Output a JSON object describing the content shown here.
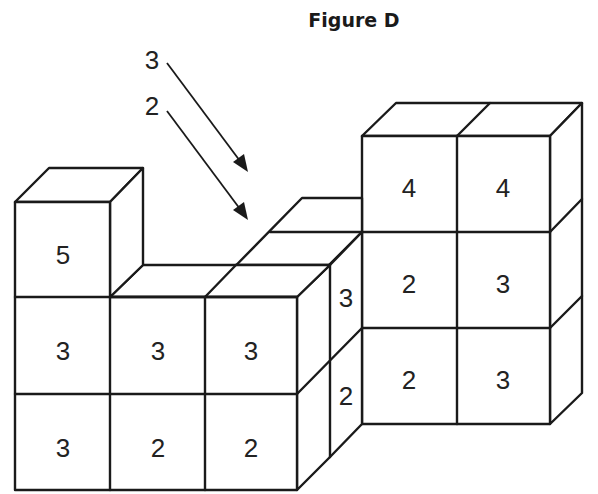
{
  "figure": {
    "title": "Figure D",
    "colors": {
      "line": "#1a1a1a",
      "background": "#ffffff"
    }
  },
  "arrows": [
    {
      "label": "3",
      "points_to": "top of back middle column"
    },
    {
      "label": "2",
      "points_to": "top of middle middle column"
    }
  ],
  "left_block": {
    "front_faces": {
      "row_top": [
        "5"
      ],
      "row_middle": [
        "3",
        "3",
        "3"
      ],
      "row_bottom": [
        "3",
        "2",
        "2"
      ]
    },
    "side_faces": {
      "upper": "3",
      "lower": "2"
    }
  },
  "right_block": {
    "front_faces": {
      "row_top": [
        "4",
        "4"
      ],
      "row_middle": [
        "2",
        "3"
      ],
      "row_bottom": [
        "2",
        "3"
      ]
    }
  }
}
